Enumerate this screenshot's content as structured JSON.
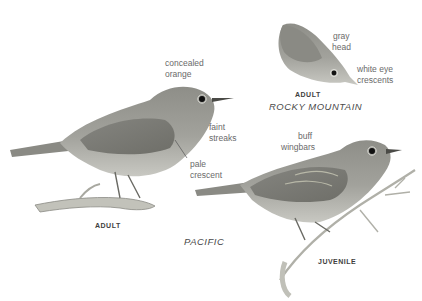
{
  "plate": {
    "background": "#ffffff",
    "ink_color": "#6a6a6a",
    "bird_colors": {
      "body": "#9a9a94",
      "wing": "#7e7e78",
      "belly": "#c4c4be",
      "branch": "#b8b8b0"
    }
  },
  "figures": [
    {
      "id": "pacific-adult",
      "caption": "ADULT",
      "annotations": [
        "concealed orange",
        "faint streaks",
        "pale crescent"
      ]
    },
    {
      "id": "rocky-mountain-adult",
      "caption": "ADULT",
      "region": "ROCKY MOUNTAIN",
      "annotations": [
        "gray head",
        "white eye crescents"
      ]
    },
    {
      "id": "pacific-juvenile",
      "caption": "JUVENILE",
      "annotations": [
        "buff wingbars"
      ]
    }
  ],
  "labels": {
    "concealed": "concealed",
    "orange": "orange",
    "faint": "faint",
    "streaks": "streaks",
    "pale": "pale",
    "crescent": "crescent",
    "gray": "gray",
    "head": "head",
    "white_eye": "white eye",
    "crescents": "crescents",
    "buff": "buff",
    "wingbars": "wingbars",
    "adult_left": "ADULT",
    "adult_rm": "ADULT",
    "juvenile": "JUVENILE",
    "pacific": "PACIFIC",
    "rocky_mountain": "ROCKY MOUNTAIN"
  }
}
